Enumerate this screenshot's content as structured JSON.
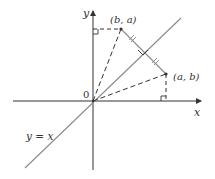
{
  "diagram": {
    "colors": {
      "axis": "#333333",
      "line": "#8a8a8a",
      "dash": "#333333",
      "text": "#333333"
    },
    "axes": {
      "x_label": "x",
      "y_label": "y",
      "origin_label": "0"
    },
    "line_label": "y = x",
    "points": [
      {
        "id": "P",
        "label": "(a, b)"
      },
      {
        "id": "Q",
        "label": "(b, a)"
      }
    ],
    "annotations": {
      "equal_segment_ticks": 2,
      "right_angle_markers": 3
    }
  }
}
